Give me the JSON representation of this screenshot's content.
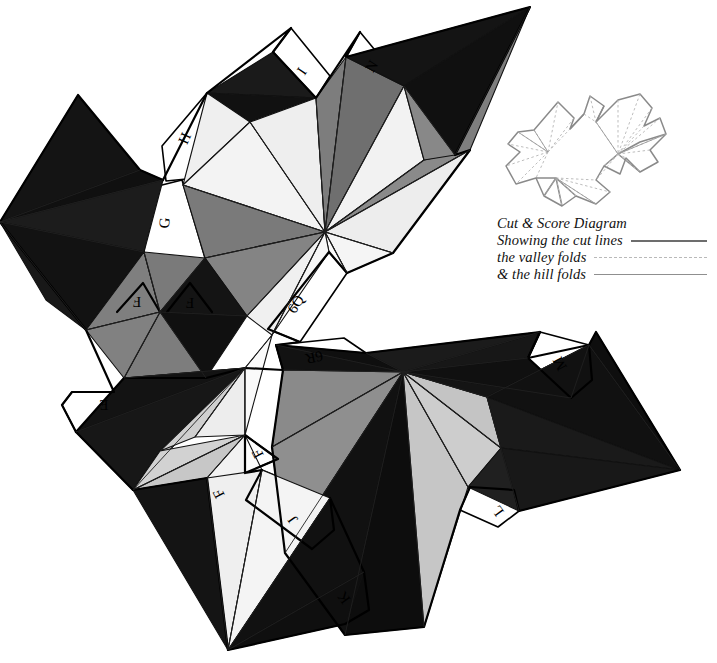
{
  "document": {
    "title": "Cut & Score Diagram",
    "background_color": "#ffffff",
    "width": 717,
    "height": 663
  },
  "legend": {
    "lines": [
      {
        "text": "Cut & Score Diagram",
        "rule": "none"
      },
      {
        "text": "Showing the cut lines",
        "rule": "cut"
      },
      {
        "text": "the valley folds",
        "rule": "valley"
      },
      {
        "text": "& the hill folds",
        "rule": "hill"
      }
    ]
  },
  "palette": {
    "paper": "#ffffff",
    "face_black": "#0d0d0d",
    "face_dark": "#2b2b2b",
    "face_mid": "#7d7d7d",
    "face_light": "#c9c9c9",
    "face_pale": "#ededed",
    "face_white": "#fbfbfb",
    "outline": "#000000",
    "score_line": "#1a1a1a",
    "thumb_stroke": "#8a8a8a",
    "thumb_dash": "#b5b5b5",
    "rule_cut": "#6d6d6d",
    "rule_valley": "#b9b9b9",
    "rule_hill": "#8f8f8f"
  },
  "tabs": [
    {
      "id": "tab-h",
      "label": "H",
      "x": 186,
      "y": 139,
      "rotate": -66
    },
    {
      "id": "tab-g",
      "label": "G",
      "x": 166,
      "y": 223,
      "rotate": -84
    },
    {
      "id": "tab-i",
      "label": "I",
      "x": 303,
      "y": 72,
      "rotate": -56
    },
    {
      "id": "tab-n",
      "label": "N",
      "x": 373,
      "y": 67,
      "rotate": -58
    },
    {
      "id": "tab-6q",
      "label": "6Q",
      "x": 297,
      "y": 305,
      "rotate": -58
    },
    {
      "id": "tab-6r",
      "label": "6R",
      "x": 314,
      "y": 356,
      "rotate": 168
    },
    {
      "id": "tab-f1",
      "label": "F",
      "x": 137,
      "y": 300,
      "rotate": 180
    },
    {
      "id": "tab-f2",
      "label": "F",
      "x": 190,
      "y": 301,
      "rotate": 180
    },
    {
      "id": "tab-e",
      "label": "E",
      "x": 104,
      "y": 403,
      "rotate": 180
    },
    {
      "id": "tab-f3",
      "label": "F",
      "x": 259,
      "y": 453,
      "rotate": -118
    },
    {
      "id": "tab-f4",
      "label": "F",
      "x": 220,
      "y": 493,
      "rotate": -118
    },
    {
      "id": "tab-j",
      "label": "J",
      "x": 294,
      "y": 519,
      "rotate": -126
    },
    {
      "id": "tab-k",
      "label": "K",
      "x": 345,
      "y": 597,
      "rotate": -126
    },
    {
      "id": "tab-m",
      "label": "M",
      "x": 561,
      "y": 363,
      "rotate": -118
    },
    {
      "id": "tab-l",
      "label": "L",
      "x": 499,
      "y": 510,
      "rotate": -126
    }
  ],
  "thumbnail": {
    "label": "miniature cut and score outline",
    "x": 500,
    "y": 92,
    "width": 165,
    "height": 110
  },
  "net": {
    "description": "Unfolded polyhedron net with shaded triangular faces and lettered glue tabs",
    "clusters": [
      {
        "id": "upper-left-fan",
        "center": [
          0,
          222
        ]
      },
      {
        "id": "upper-middle-fan",
        "center": [
          325,
          232
        ]
      },
      {
        "id": "upper-right-kite",
        "center": [
          410,
          105
        ]
      },
      {
        "id": "mid-left-fan",
        "center": [
          160,
          312
        ]
      },
      {
        "id": "lower-left-fan",
        "center": [
          245,
          368
        ]
      },
      {
        "id": "lower-middle-fan",
        "center": [
          403,
          372
        ]
      },
      {
        "id": "lower-right-kite",
        "center": [
          560,
          400
        ]
      },
      {
        "id": "bottom-kite",
        "center": [
          228,
          650
        ]
      }
    ]
  }
}
